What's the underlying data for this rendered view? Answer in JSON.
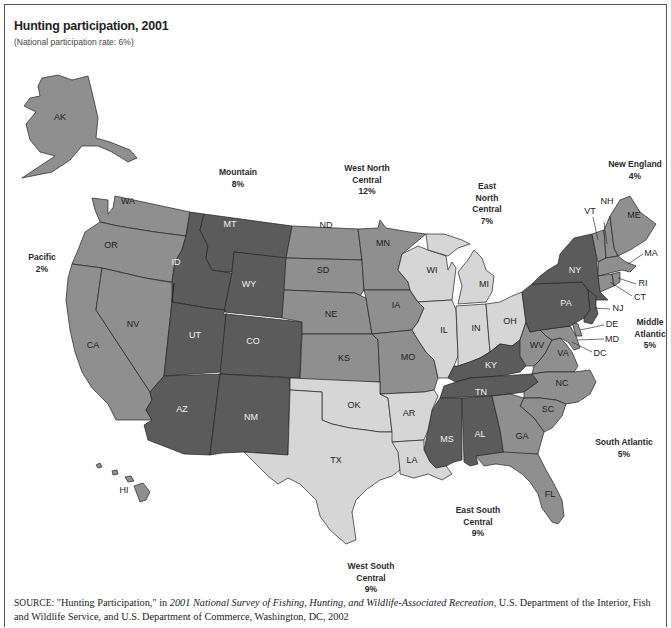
{
  "header": {
    "title": "Hunting participation, 2001",
    "subtitle": "(National participation rate: 6%)"
  },
  "regions": {
    "pacific": {
      "name": "Pacific",
      "rate": "2%"
    },
    "mountain": {
      "name": "Mountain",
      "rate": "8%"
    },
    "west_north_central": {
      "name_line1": "West North",
      "name_line2": "Central",
      "rate": "12%"
    },
    "east_north_central": {
      "name_line1": "East",
      "name_line2": "North",
      "name_line3": "Central",
      "rate": "7%"
    },
    "new_england": {
      "name": "New England",
      "rate": "4%"
    },
    "middle_atlantic": {
      "name_line1": "Middle",
      "name_line2": "Atlantic",
      "rate": "5%"
    },
    "south_atlantic": {
      "name": "South Atlantic",
      "rate": "5%"
    },
    "east_south_central": {
      "name_line1": "East South",
      "name_line2": "Central",
      "rate": "9%"
    },
    "west_south_central": {
      "name_line1": "West South",
      "name_line2": "Central",
      "rate": "9%"
    }
  },
  "states": {
    "AK": "AK",
    "HI": "HI",
    "WA": "WA",
    "OR": "OR",
    "CA": "CA",
    "NV": "NV",
    "ID": "ID",
    "MT": "MT",
    "WY": "WY",
    "UT": "UT",
    "CO": "CO",
    "AZ": "AZ",
    "NM": "NM",
    "ND": "ND",
    "SD": "SD",
    "NE": "NE",
    "KS": "KS",
    "MN": "MN",
    "IA": "IA",
    "MO": "MO",
    "WI": "WI",
    "MI": "MI",
    "IL": "IL",
    "IN": "IN",
    "OH": "OH",
    "KY": "KY",
    "TN": "TN",
    "MS": "MS",
    "AL": "AL",
    "OK": "OK",
    "TX": "TX",
    "AR": "AR",
    "LA": "LA",
    "WV": "WV",
    "VA": "VA",
    "NC": "NC",
    "SC": "SC",
    "GA": "GA",
    "FL": "FL",
    "MD": "MD",
    "DE": "DE",
    "DC": "DC",
    "NY": "NY",
    "PA": "PA",
    "NJ": "NJ",
    "ME": "ME",
    "NH": "NH",
    "VT": "VT",
    "MA": "MA",
    "RI": "RI",
    "CT": "CT"
  },
  "colors": {
    "tier_high": "#5b5b5b",
    "tier_mid": "#8f8f8f",
    "tier_low": "#d6d6d6"
  },
  "source": {
    "prefix": "SOURCE:",
    "text1": " \"Hunting Participation,\" in ",
    "publication": "2001 National Survey of Fishing, Hunting, and Wildlife-Associated Recreation,",
    "text2": " U.S. Department of the Interior, Fish and Wildlife Service, and U.S. Department of Commerce, Washington, DC, 2002"
  }
}
